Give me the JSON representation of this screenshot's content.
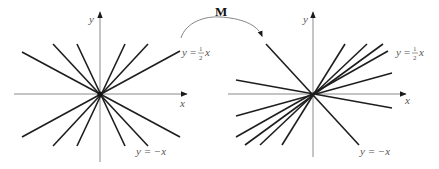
{
  "figure": {
    "transform_label": "M",
    "left_panel": {
      "origin": [
        100,
        94
      ],
      "axis_labels": {
        "x": "x",
        "y": "y"
      },
      "line_label_top": {
        "lhs": "y",
        "eq": "=",
        "num": "1",
        "den": "2",
        "var": "x"
      },
      "line_label_bottom": "y = −x",
      "lines": [
        [
          22,
          52,
          180,
          137
        ],
        [
          53,
          44,
          148,
          146
        ],
        [
          77,
          44,
          125,
          146
        ],
        [
          125,
          44,
          77,
          146
        ],
        [
          148,
          44,
          53,
          146
        ],
        [
          180,
          51,
          22,
          137
        ]
      ]
    },
    "right_panel": {
      "origin": [
        313,
        94
      ],
      "axis_labels": {
        "x": "x",
        "y": "y"
      },
      "line_label_top": {
        "lhs": "y",
        "eq": "=",
        "num": "1",
        "den": "2",
        "var": "x"
      },
      "line_label_bottom": "y = −x",
      "lines": [
        [
          266,
          44,
          359,
          145
        ],
        [
          236,
          80,
          392,
          108
        ],
        [
          345,
          44,
          282,
          145
        ],
        [
          367,
          44,
          260,
          145
        ],
        [
          383,
          44,
          245,
          145
        ],
        [
          388,
          51,
          236,
          137
        ],
        [
          392,
          73,
          236,
          116
        ]
      ]
    },
    "colors": {
      "line": "#1e1e1e",
      "axis": "#8a8a8a",
      "label": "#555555",
      "arrow_label": "#111111"
    }
  }
}
